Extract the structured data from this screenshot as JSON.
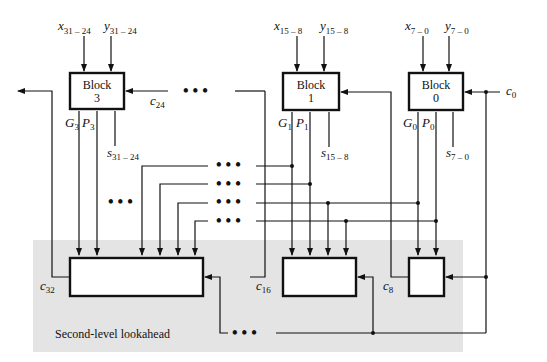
{
  "diagram": {
    "region_label": "Second-level lookahead",
    "region_color": "#e4e4e4",
    "blocks": [
      {
        "id": "block3",
        "label": "Block",
        "number": "3",
        "x_in": "x",
        "x_sub": "31 – 24",
        "y_in": "y",
        "y_sub": "31 – 24",
        "g": "G",
        "g_sub": "3",
        "p": "P",
        "p_sub": "3",
        "s": "s",
        "s_sub": "31 – 24",
        "carry_in": "c",
        "carry_in_sub": "24"
      },
      {
        "id": "block1",
        "label": "Block",
        "number": "1",
        "x_in": "x",
        "x_sub": "15 – 8",
        "y_in": "y",
        "y_sub": "15 – 8",
        "g": "G",
        "g_sub": "1",
        "p": "P",
        "p_sub": "1",
        "s": "s",
        "s_sub": "15 – 8"
      },
      {
        "id": "block0",
        "label": "Block",
        "number": "0",
        "x_in": "x",
        "x_sub": "7 – 0",
        "y_in": "y",
        "y_sub": "7 – 0",
        "g": "G",
        "g_sub": "0",
        "p": "P",
        "p_sub": "0",
        "s": "s",
        "s_sub": "7 – 0",
        "carry_in": "c",
        "carry_in_sub": "0"
      }
    ],
    "carries": [
      {
        "name": "c",
        "sub": "32"
      },
      {
        "name": "c",
        "sub": "16"
      },
      {
        "name": "c",
        "sub": "8"
      }
    ],
    "ellipsis": "• • •"
  }
}
